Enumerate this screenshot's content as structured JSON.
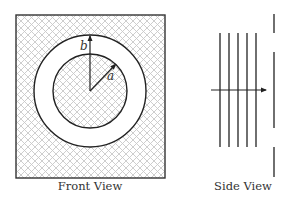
{
  "figure": {
    "front_view": {
      "caption": "Front View",
      "hatch_color": "#c8c8c8",
      "frame": {
        "x": 16,
        "y": 15,
        "width": 149,
        "height": 163
      },
      "center": {
        "x": 90,
        "y": 91
      },
      "outer_radius": 56,
      "inner_radius": 37,
      "labels": {
        "outer": "b",
        "inner": "a"
      }
    },
    "side_view": {
      "caption": "Side View",
      "plate_count": 5,
      "plate_x": [
        220,
        229,
        238,
        247,
        256
      ],
      "plate_top": 33,
      "plate_bottom": 147,
      "arrow": {
        "x1": 211,
        "x2": 266,
        "y": 90
      },
      "screen": {
        "x": 274,
        "segments": [
          [
            14,
            33
          ],
          [
            52,
            128
          ],
          [
            147,
            177
          ]
        ]
      }
    }
  }
}
